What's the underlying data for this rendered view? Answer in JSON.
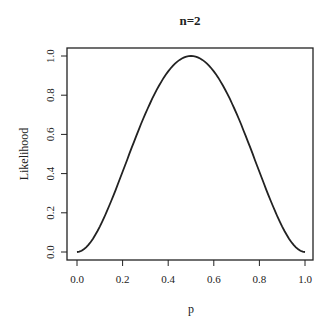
{
  "chart_data": {
    "type": "line",
    "title": "n=2",
    "xlabel": "p",
    "ylabel": "Likelihood",
    "xlim": [
      0,
      1
    ],
    "ylim": [
      0,
      1
    ],
    "xticks": [
      "0.0",
      "0.2",
      "0.4",
      "0.6",
      "0.8",
      "1.0"
    ],
    "yticks": [
      "0.0",
      "0.2",
      "0.4",
      "0.6",
      "0.8",
      "1.0"
    ],
    "x": [
      0,
      0.1,
      0.2,
      0.3,
      0.4,
      0.5,
      0.6,
      0.7,
      0.8,
      0.9,
      1.0
    ],
    "series": [
      {
        "name": "Likelihood",
        "values": [
          0,
          0.13,
          0.41,
          0.71,
          0.92,
          1.0,
          0.92,
          0.71,
          0.41,
          0.13,
          0
        ]
      }
    ],
    "grid": false,
    "legend": null
  }
}
